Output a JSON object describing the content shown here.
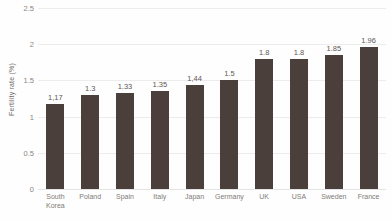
{
  "chart_data": {
    "type": "bar",
    "title": "",
    "subtitle": "",
    "xlabel": "",
    "ylabel": "Fertility rate (%)",
    "ylim": [
      0,
      2.5
    ],
    "yticks": [
      "0",
      "0.5",
      "1",
      "1.5",
      "2",
      "2.5"
    ],
    "ytick_values": [
      0,
      0.5,
      1,
      1.5,
      2,
      2.5
    ],
    "grid": true,
    "legend": "none",
    "orientation": "vertical",
    "bar_color": "#4a3f3a",
    "gridline_color": "#ececec",
    "background_color": "#fefefe",
    "categories": [
      "South\nKorea",
      "Poland",
      "Spain",
      "Italy",
      "Japan",
      "Germany",
      "UK",
      "USA",
      "Sweden",
      "France"
    ],
    "values": [
      1.17,
      1.3,
      1.33,
      1.35,
      1.44,
      1.5,
      1.8,
      1.8,
      1.85,
      1.96
    ],
    "data_labels": [
      "1,17",
      "1.3",
      "1.33",
      "1.35",
      "1,44",
      "1.5",
      "1.8",
      "1.8",
      "1.85",
      "1.96"
    ]
  }
}
